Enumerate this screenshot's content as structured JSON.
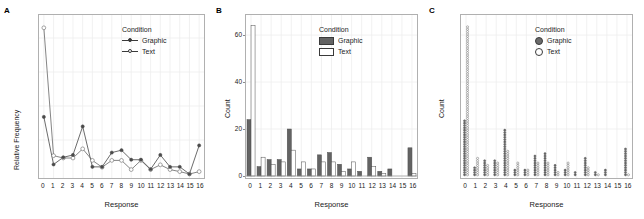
{
  "figure": {
    "panels": [
      {
        "letter": "A"
      },
      {
        "letter": "B"
      },
      {
        "letter": "C"
      }
    ],
    "legend_title": "Condition",
    "series_names": [
      "Graphic",
      "Text"
    ],
    "xlabel": "Response",
    "colors": {
      "graphic_fill": "#636363",
      "text_fill": "#ffffff",
      "outline": "#4d4d4d",
      "grid": "#eeeeee",
      "panel_border": "#b0b0b0"
    }
  },
  "chart_data": [
    {
      "type": "line",
      "panel": "A",
      "title": "",
      "xlabel": "Response",
      "ylabel": "Relative Frequency",
      "legend_title": "Condition",
      "legend_position": "top-right inside",
      "grid": true,
      "categories": [
        "0",
        "1",
        "2",
        "3",
        "4",
        "5",
        "6",
        "7",
        "8",
        "9",
        "10",
        "11",
        "12",
        "13",
        "14",
        "15",
        "16"
      ],
      "xlim": [
        0,
        16
      ],
      "ylim": [
        0,
        0.45
      ],
      "yticklabels": [],
      "series": [
        {
          "name": "Graphic",
          "marker": "filled-circle",
          "values": [
            0.168,
            0.028,
            0.049,
            0.056,
            0.14,
            0.021,
            0.021,
            0.063,
            0.07,
            0.042,
            0.042,
            0.014,
            0.056,
            0.021,
            0.021,
            0.0,
            0.084
          ]
        },
        {
          "name": "Text",
          "marker": "open-circle",
          "values": [
            0.43,
            0.054,
            0.047,
            0.047,
            0.074,
            0.04,
            0.02,
            0.04,
            0.04,
            0.013,
            0.04,
            0.013,
            0.027,
            0.013,
            0.007,
            0.0,
            0.007
          ]
        }
      ]
    },
    {
      "type": "bar",
      "panel": "B",
      "title": "",
      "xlabel": "Response",
      "ylabel": "Count",
      "legend_title": "Condition",
      "legend_position": "top-right inside",
      "grid": true,
      "categories": [
        "0",
        "1",
        "2",
        "3",
        "4",
        "5",
        "6",
        "7",
        "8",
        "9",
        "10",
        "11",
        "12",
        "13",
        "14",
        "15",
        "16"
      ],
      "ylim": [
        0,
        66
      ],
      "yticks": [
        0,
        20,
        40,
        60
      ],
      "series": [
        {
          "name": "Graphic",
          "values": [
            24,
            4,
            7,
            7,
            20,
            3,
            3,
            9,
            10,
            5,
            3,
            2,
            8,
            2,
            3,
            0,
            12
          ]
        },
        {
          "name": "Text",
          "values": [
            64,
            8,
            5,
            6,
            11,
            6,
            3,
            6,
            6,
            2,
            6,
            0,
            4,
            1,
            0,
            0,
            1
          ]
        }
      ]
    },
    {
      "type": "scatter",
      "subtype": "dotplot",
      "panel": "C",
      "title": "",
      "xlabel": "Response",
      "ylabel": "Count",
      "legend_title": "Condition",
      "legend_position": "top-right inside",
      "grid": true,
      "categories": [
        "0",
        "1",
        "2",
        "3",
        "4",
        "5",
        "6",
        "7",
        "8",
        "9",
        "10",
        "11",
        "12",
        "13",
        "14",
        "15",
        "16"
      ],
      "ylim": [
        0,
        66
      ],
      "yticklabels": [],
      "series": [
        {
          "name": "Graphic",
          "marker": "filled-circle",
          "values": [
            24,
            4,
            7,
            7,
            20,
            3,
            3,
            9,
            10,
            5,
            3,
            2,
            8,
            2,
            3,
            0,
            12
          ]
        },
        {
          "name": "Text",
          "marker": "open-circle",
          "values": [
            64,
            8,
            5,
            6,
            11,
            6,
            3,
            6,
            6,
            2,
            6,
            0,
            4,
            1,
            0,
            0,
            1
          ]
        }
      ]
    }
  ]
}
